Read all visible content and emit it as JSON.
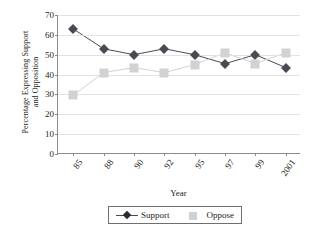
{
  "chart_data": {
    "type": "line",
    "title": "",
    "xlabel": "Year",
    "ylabel": "Percentage Expressing Support\nand Opposition",
    "categories": [
      "85",
      "88",
      "90",
      "92",
      "95",
      "97",
      "99",
      "2001"
    ],
    "ylim": [
      0,
      70
    ],
    "yticks": [
      0,
      10,
      20,
      30,
      40,
      50,
      60,
      70
    ],
    "grid": true,
    "legend_position": "bottom-center",
    "series": [
      {
        "name": "Support",
        "marker": "diamond",
        "color": "#4a4a52",
        "values": [
          63,
          53,
          50,
          53,
          50,
          45.5,
          50,
          43.5
        ]
      },
      {
        "name": "Oppose",
        "marker": "square",
        "color": "#d2d2d2",
        "values": [
          29.5,
          41,
          43.5,
          41,
          45,
          51,
          45.5,
          51
        ]
      }
    ]
  },
  "legend": {
    "entries": [
      {
        "label": "Support"
      },
      {
        "label": "Oppose"
      }
    ]
  }
}
